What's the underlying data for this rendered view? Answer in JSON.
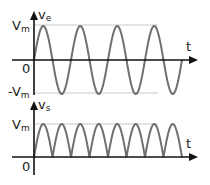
{
  "diagram": {
    "colors": {
      "axis": "#111111",
      "wave": "#707070",
      "guide": "#c8c8c8"
    },
    "top_plot": {
      "y_axis_label": "v",
      "y_axis_sub": "e",
      "x_axis_label": "t",
      "vmax_label": "V",
      "vmax_sub": "m",
      "vmin_label": "-V",
      "vmin_sub": "m",
      "origin_label": "0",
      "waveform": "sine",
      "cycles": 4
    },
    "bottom_plot": {
      "y_axis_label": "v",
      "y_axis_sub": "s",
      "x_axis_label": "t",
      "vmax_label": "V",
      "vmax_sub": "m",
      "origin_label": "0",
      "waveform": "rectified |sine|",
      "humps": 8
    }
  }
}
